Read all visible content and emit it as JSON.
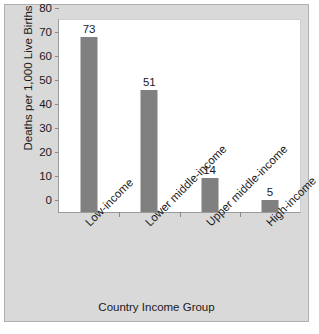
{
  "chart_data": {
    "type": "bar",
    "title": "",
    "xlabel": "Country Income Group",
    "ylabel": "Deaths per 1,000 Live Births",
    "categories": [
      "Low-income",
      "Lower middle-income",
      "Upper middle-income",
      "High-income"
    ],
    "values": [
      73,
      51,
      14,
      5
    ],
    "value_labels": [
      "73",
      "51",
      "14",
      "5"
    ],
    "ylim": [
      0,
      80
    ],
    "ytick_labels": [
      "0",
      "10",
      "20",
      "30",
      "40",
      "50",
      "60",
      "70",
      "80"
    ],
    "ytick_values": [
      0,
      10,
      20,
      30,
      40,
      50,
      60,
      70,
      80
    ],
    "grid": false,
    "legend": false,
    "bar_color": "#808080",
    "plot_background": "#ffffff",
    "figure_background": "#d9d9d9",
    "axis_color": "#9a9a9a",
    "text_color": "#1a1a1a"
  }
}
